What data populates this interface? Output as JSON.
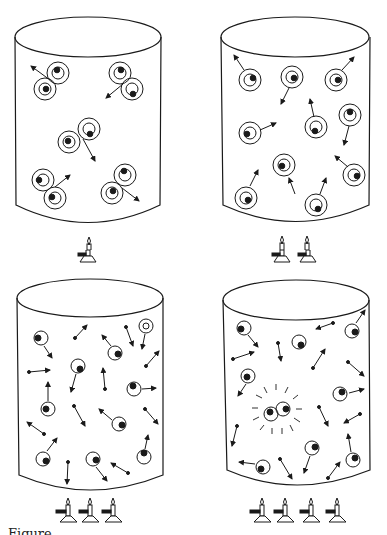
{
  "figure": {
    "panels": [
      {
        "id": "panel-1",
        "burners": 1,
        "state": "diatomic molecules (atoms paired)",
        "particle_count": 10
      },
      {
        "id": "panel-2",
        "burners": 2,
        "state": "dissociated atoms",
        "particle_count": 11
      },
      {
        "id": "panel-3",
        "burners": 3,
        "state": "atoms with free electrons (partial ionization)",
        "particle_count": 10
      },
      {
        "id": "panel-4",
        "burners": 4,
        "state": "ions and free electrons (plasma), with a collision flash",
        "particle_count": 9
      }
    ],
    "colors": {
      "ink": "#1a1a1a",
      "background": "#ffffff"
    }
  },
  "caption": {
    "text": "Figure"
  }
}
